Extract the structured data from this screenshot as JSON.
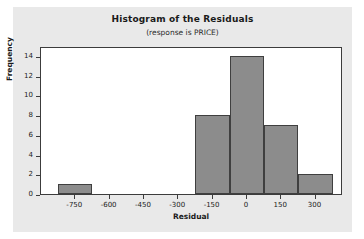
{
  "chart_data": {
    "type": "bar",
    "title": "Histogram of the Residuals",
    "subtitle": "(response is PRICE)",
    "xlabel": "Residual",
    "ylabel": "Frequency",
    "xlim": [
      -900,
      420
    ],
    "ylim": [
      0,
      15
    ],
    "grid": false,
    "legend": null,
    "bin_width": 150,
    "bar_color": "#8c8c8c",
    "bar_edge_color": "#3f3f3f",
    "plot_background": "#ffffff",
    "figure_background": "#e9e9e9",
    "categories": [
      -750,
      -600,
      -450,
      -300,
      -150,
      0,
      150,
      300
    ],
    "values": [
      1,
      0,
      0,
      0,
      8,
      14,
      7,
      2
    ],
    "bins": [
      {
        "center": -750,
        "start": -825,
        "end": -675,
        "frequency": 1
      },
      {
        "center": -600,
        "start": -675,
        "end": -525,
        "frequency": 0
      },
      {
        "center": -450,
        "start": -525,
        "end": -375,
        "frequency": 0
      },
      {
        "center": -300,
        "start": -375,
        "end": -225,
        "frequency": 0
      },
      {
        "center": -150,
        "start": -225,
        "end": -75,
        "frequency": 8
      },
      {
        "center": 0,
        "start": -75,
        "end": 75,
        "frequency": 14
      },
      {
        "center": 150,
        "start": 75,
        "end": 225,
        "frequency": 7
      },
      {
        "center": 300,
        "start": 225,
        "end": 375,
        "frequency": 2
      }
    ],
    "xticks": [
      -750,
      -600,
      -450,
      -300,
      -150,
      0,
      150,
      300
    ],
    "xtick_labels": [
      "-750",
      "-600",
      "-450",
      "-300",
      "-150",
      "0",
      "150",
      "300"
    ],
    "yticks": [
      0,
      2,
      4,
      6,
      8,
      10,
      12,
      14
    ],
    "ytick_labels": [
      "0",
      "2",
      "4",
      "6",
      "8",
      "10",
      "12",
      "14"
    ]
  }
}
